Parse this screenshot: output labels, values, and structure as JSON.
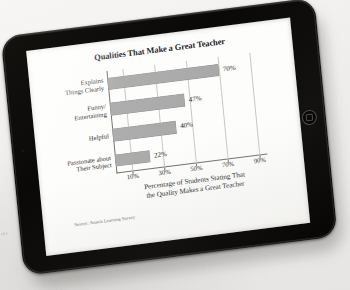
{
  "device": {
    "name": "tablet",
    "bezel_color": "#0b0a09",
    "home_button_name": "home-button",
    "camera_name": "front-camera"
  },
  "backdrop": {
    "edge_scrap_text": "t h e"
  },
  "chart_data": {
    "type": "bar",
    "orientation": "horizontal",
    "title": "Qualities That Make a Great Teacher",
    "categories": [
      "Explains\nThings Clearly",
      "Funny/\nEntertaining",
      "Helpful",
      "Passionate about\nTheir Subject"
    ],
    "values": [
      70,
      47,
      40,
      22
    ],
    "value_labels": [
      "70%",
      "47%",
      "40%",
      "22%"
    ],
    "xlabel": "Percentage of Students Stating That the Quality Makes a Great Teacher",
    "ylabel": "",
    "xlim": [
      0,
      95
    ],
    "xticks": [
      10,
      30,
      50,
      70,
      90
    ],
    "xtick_labels": [
      "10%",
      "30%",
      "50%",
      "70%",
      "90%"
    ],
    "grid": true,
    "grid_axis": "x",
    "legend": false,
    "bar_color": "#a9a9a9",
    "source": "Source: Avanta Learning Survey"
  },
  "chart_view": {
    "title": "Qualities That Make a Great Teacher",
    "axis_title_line1": "Percentage of Students Stating That",
    "axis_title_line2": "the Quality Makes a Great Teacher",
    "source": "Source: Avanta Learning Survey",
    "categories": [
      {
        "line1": "Explains",
        "line2": "Things Clearly",
        "value_label": "70%"
      },
      {
        "line1": "Funny/",
        "line2": "Entertaining",
        "value_label": "47%"
      },
      {
        "line1": "Helpful",
        "line2": "",
        "value_label": "40%"
      },
      {
        "line1": "Passionate about",
        "line2": "Their Subject",
        "value_label": "22%"
      }
    ],
    "ticks": [
      "10%",
      "30%",
      "50%",
      "70%",
      "90%"
    ]
  }
}
